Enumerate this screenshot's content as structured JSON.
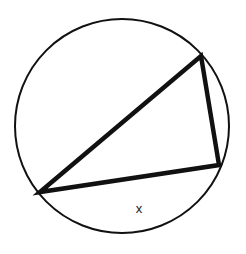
{
  "diagram": {
    "type": "inscribed-triangle-in-circle",
    "canvas": {
      "width": 246,
      "height": 254,
      "background": "#ffffff"
    },
    "circle": {
      "cx": 122,
      "cy": 126,
      "r": 107,
      "stroke": "#111111",
      "stroke_width": 2
    },
    "triangle": {
      "vertices": [
        {
          "name": "left",
          "x": 40,
          "y": 192
        },
        {
          "name": "top-right",
          "x": 201,
          "y": 56
        },
        {
          "name": "bottom-right",
          "x": 219,
          "y": 165
        }
      ],
      "stroke": "#111111",
      "stroke_width": 4.5
    },
    "labels": [
      {
        "id": "arc-x",
        "text": "x",
        "x": 139,
        "y": 213,
        "describes": "arc between left vertex and bottom-right vertex"
      }
    ]
  }
}
